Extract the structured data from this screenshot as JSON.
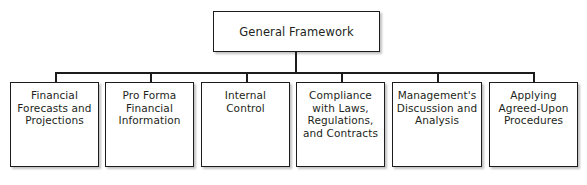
{
  "diagram": {
    "type": "organizational-hierarchy",
    "orientation": "top-down",
    "root": {
      "id": "general-framework",
      "label": "General Framework"
    },
    "children": [
      {
        "id": "financial-forecasts-and-projections",
        "label": "Financial\nForecasts and\nProjections"
      },
      {
        "id": "pro-forma-financial-information",
        "label": "Pro Forma\nFinancial\nInformation"
      },
      {
        "id": "internal-control",
        "label": "Internal\nControl"
      },
      {
        "id": "compliance-with-laws-regulations-and-contracts",
        "label": "Compliance\nwith Laws,\nRegulations,\nand Contracts"
      },
      {
        "id": "managements-discussion-and-analysis",
        "label": "Management's\nDiscussion and\nAnalysis"
      },
      {
        "id": "applying-agreed-upon-procedures",
        "label": "Applying\nAgreed-Upon\nProcedures"
      }
    ],
    "colors": {
      "background": "#ffffff",
      "border": "#1c1c1c",
      "text": "#231f20",
      "shadow": "#787878"
    }
  }
}
